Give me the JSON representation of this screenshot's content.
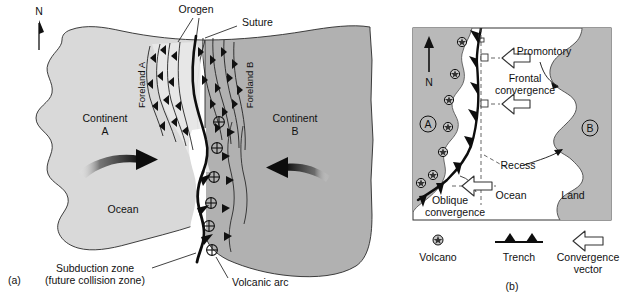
{
  "figure": {
    "title_absent": "",
    "panels": [
      {
        "tag": "(a)",
        "name": "continental-collision-map",
        "labels": {
          "north": "N",
          "orogen": "Orogen",
          "suture": "Suture",
          "foreland_a": "Foreland A",
          "foreland_b": "Foreland B",
          "continent_a_line1": "Continent",
          "continent_a_line2": "A",
          "continent_b_line1": "Continent",
          "continent_b_line2": "B",
          "ocean": "Ocean",
          "subduction_line1": "Subduction zone",
          "subduction_line2": "(future collision zone)",
          "volcanic_arc": "Volcanic arc"
        }
      },
      {
        "tag": "(b)",
        "name": "convergence-geometry-map",
        "labels": {
          "north": "N",
          "plate_a": "A",
          "plate_b": "B",
          "promontory": "Promontory",
          "frontal_line1": "Frontal",
          "frontal_line2": "convergence",
          "oblique_line1": "Oblique",
          "oblique_line2": "convergence",
          "recess": "Recess",
          "ocean": "Ocean",
          "land": "Land"
        },
        "legend": [
          {
            "icon": "volcano-icon",
            "label": "Volcano"
          },
          {
            "icon": "trench-icon",
            "label": "Trench"
          },
          {
            "icon": "convergence-vector-icon",
            "label_line1": "Convergence",
            "label_line2": "vector"
          }
        ]
      }
    ]
  },
  "colors": {
    "continent_a_fill": "#d9d9d9",
    "continent_b_fill": "#b1b1b1",
    "orogen_fill": "#e8e8e8",
    "plate_a_fill": "#b9b9b9",
    "land_b_fill": "#b9b9b9",
    "ocean_fill": "#ffffff",
    "stroke": "#111111",
    "arrow_black": "#0d0d0d",
    "frame": "#333333"
  }
}
